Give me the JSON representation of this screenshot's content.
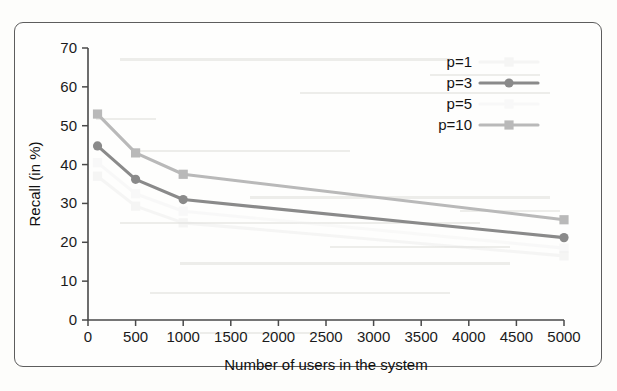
{
  "figure": {
    "border_color": "#5d5d5d",
    "background": "#fefefd"
  },
  "chart_data": {
    "type": "line",
    "title": "",
    "xlabel": "Number of users in the system",
    "ylabel": "Recall (in %)",
    "xlim": [
      0,
      5000
    ],
    "ylim": [
      0,
      70
    ],
    "xticks": [
      0,
      500,
      1000,
      1500,
      2000,
      2500,
      3000,
      3500,
      4000,
      4500,
      5000
    ],
    "yticks": [
      0,
      10,
      20,
      30,
      40,
      50,
      60,
      70
    ],
    "grid": false,
    "legend_position": "top-right",
    "x": [
      100,
      500,
      1000,
      5000
    ],
    "series": [
      {
        "name": "p=1",
        "label": "p=1",
        "color": "#e2e2e2",
        "marker": "square",
        "visible_faint": true,
        "values": [
          37.0,
          29.3,
          25.0,
          16.5
        ]
      },
      {
        "name": "p=3",
        "label": "p=3",
        "color": "#8a8a8a",
        "marker": "circle",
        "visible_faint": false,
        "values": [
          44.8,
          36.2,
          31.0,
          21.2
        ]
      },
      {
        "name": "p=5",
        "label": "p=5",
        "color": "#ededed",
        "marker": "square",
        "visible_faint": true,
        "values": [
          40.5,
          32.5,
          28.0,
          18.5
        ]
      },
      {
        "name": "p=10",
        "label": "p=10",
        "color": "#b9b9b9",
        "marker": "square",
        "visible_faint": false,
        "values": [
          53.0,
          43.0,
          37.5,
          25.8
        ]
      }
    ]
  },
  "legend": {
    "entries": [
      {
        "label": "p=1"
      },
      {
        "label": "p=3"
      },
      {
        "label": "p=5"
      },
      {
        "label": "p=10"
      }
    ]
  },
  "axis": {
    "y_title": "Recall (in %)",
    "x_title": "Number of users in the system",
    "y_tick_labels": [
      "0",
      "10",
      "20",
      "30",
      "40",
      "50",
      "60",
      "70"
    ],
    "x_tick_labels": [
      "0",
      "500",
      "1000",
      "1500",
      "2000",
      "2500",
      "3000",
      "3500",
      "4000",
      "4500",
      "5000"
    ]
  }
}
